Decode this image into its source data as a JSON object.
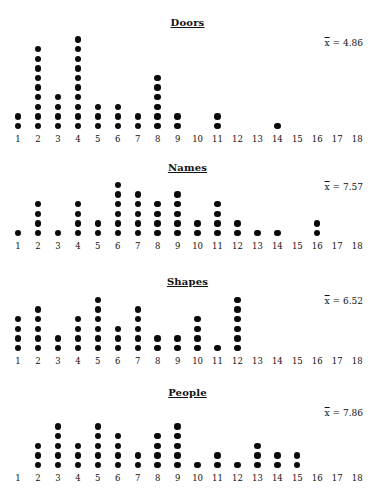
{
  "chart_data": [
    {
      "type": "dot_plot",
      "title": "Doors",
      "mean_label": "x̄ = 4.86",
      "mean_value": 4.86,
      "x": [
        1,
        2,
        3,
        4,
        5,
        6,
        7,
        8,
        9,
        10,
        11,
        12,
        13,
        14,
        15,
        16,
        17,
        18
      ],
      "counts": [
        2,
        9,
        4,
        10,
        3,
        3,
        2,
        6,
        2,
        0,
        2,
        0,
        0,
        1,
        0,
        0,
        0,
        0
      ]
    },
    {
      "type": "dot_plot",
      "title": "Names",
      "mean_label": "x̄ = 7.57",
      "mean_value": 7.57,
      "x": [
        1,
        2,
        3,
        4,
        5,
        6,
        7,
        8,
        9,
        10,
        11,
        12,
        13,
        14,
        15,
        16,
        17,
        18
      ],
      "counts": [
        1,
        4,
        1,
        4,
        2,
        6,
        5,
        4,
        5,
        2,
        4,
        2,
        1,
        1,
        0,
        2,
        0,
        0
      ]
    },
    {
      "type": "dot_plot",
      "title": "Shapes",
      "mean_label": "x̄ = 6.52",
      "mean_value": 6.52,
      "x": [
        1,
        2,
        3,
        4,
        5,
        6,
        7,
        8,
        9,
        10,
        11,
        12,
        13,
        14,
        15,
        16,
        17,
        18
      ],
      "counts": [
        4,
        5,
        2,
        4,
        6,
        3,
        5,
        2,
        2,
        4,
        1,
        6,
        0,
        0,
        0,
        0,
        0,
        0
      ]
    },
    {
      "type": "dot_plot",
      "title": "People",
      "mean_label": "x̄ = 7.86",
      "mean_value": 7.86,
      "x": [
        1,
        2,
        3,
        4,
        5,
        6,
        7,
        8,
        9,
        10,
        11,
        12,
        13,
        14,
        15,
        16,
        17,
        18
      ],
      "counts": [
        0,
        3,
        5,
        3,
        5,
        4,
        2,
        4,
        5,
        1,
        2,
        1,
        3,
        2,
        2,
        0,
        0,
        0
      ]
    }
  ],
  "panels": [
    {
      "title": "Doors",
      "mean_prefix": "x",
      "mean_suffix": " = 4.86"
    },
    {
      "title": "Names",
      "mean_prefix": "x",
      "mean_suffix": " = 7.57"
    },
    {
      "title": "Shapes",
      "mean_prefix": "x",
      "mean_suffix": " = 6.52"
    },
    {
      "title": "People",
      "mean_prefix": "x",
      "mean_suffix": " = 7.86"
    }
  ]
}
